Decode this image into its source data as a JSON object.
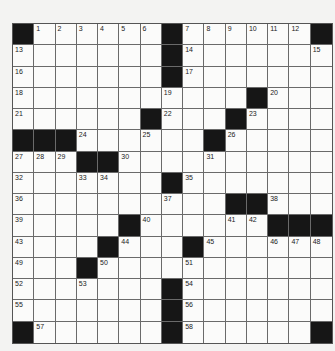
{
  "puzzle": {
    "size": 15,
    "rows": [
      [
        "#",
        "1",
        "2",
        "3",
        "4",
        "5",
        "6",
        "#",
        "7",
        "8",
        "9",
        "10",
        "11",
        "12",
        "#"
      ],
      [
        "13",
        ".",
        ".",
        ".",
        ".",
        ".",
        ".",
        "#",
        "14",
        ".",
        ".",
        ".",
        ".",
        ".",
        "15"
      ],
      [
        "16",
        ".",
        ".",
        ".",
        ".",
        ".",
        ".",
        "#",
        "17",
        ".",
        ".",
        ".",
        ".",
        ".",
        "."
      ],
      [
        "18",
        ".",
        ".",
        ".",
        ".",
        ".",
        ".",
        "19",
        ".",
        ".",
        ".",
        "#",
        "20",
        ".",
        "."
      ],
      [
        "21",
        ".",
        ".",
        ".",
        ".",
        ".",
        "#",
        "22",
        ".",
        ".",
        "#",
        "23",
        ".",
        ".",
        "."
      ],
      [
        "#",
        "#",
        "#",
        "24",
        ".",
        ".",
        "25",
        ".",
        ".",
        "#",
        "26",
        ".",
        ".",
        ".",
        "."
      ],
      [
        "27",
        "28",
        "29",
        "#",
        "#",
        "30",
        ".",
        ".",
        ".",
        "31",
        ".",
        ".",
        ".",
        ".",
        "."
      ],
      [
        "32",
        ".",
        ".",
        "33",
        "34",
        ".",
        ".",
        "#",
        "35",
        ".",
        ".",
        ".",
        ".",
        ".",
        "."
      ],
      [
        "36",
        ".",
        ".",
        ".",
        ".",
        ".",
        ".",
        "37",
        ".",
        ".",
        "#",
        "#",
        "38",
        ".",
        "."
      ],
      [
        "39",
        ".",
        ".",
        ".",
        ".",
        "#",
        "40",
        ".",
        ".",
        ".",
        "41",
        "42",
        "#",
        "#",
        "#"
      ],
      [
        "43",
        ".",
        ".",
        ".",
        "#",
        "44",
        ".",
        ".",
        "#",
        "45",
        ".",
        ".",
        "46",
        "47",
        "48"
      ],
      [
        "49",
        ".",
        ".",
        "#",
        "50",
        ".",
        ".",
        ".",
        "51",
        ".",
        ".",
        ".",
        ".",
        ".",
        "."
      ],
      [
        "52",
        ".",
        ".",
        "53",
        ".",
        ".",
        ".",
        "#",
        "54",
        ".",
        ".",
        ".",
        ".",
        ".",
        "."
      ],
      [
        "55",
        ".",
        ".",
        ".",
        ".",
        ".",
        ".",
        "#",
        "56",
        ".",
        ".",
        ".",
        ".",
        ".",
        "."
      ],
      [
        "#",
        "57",
        ".",
        ".",
        ".",
        ".",
        ".",
        "#",
        "58",
        ".",
        ".",
        ".",
        ".",
        ".",
        "#"
      ]
    ]
  },
  "colors": {
    "black_cell": "#161616",
    "white_cell": "#fbfbfa",
    "background": "#f3f3f2"
  }
}
